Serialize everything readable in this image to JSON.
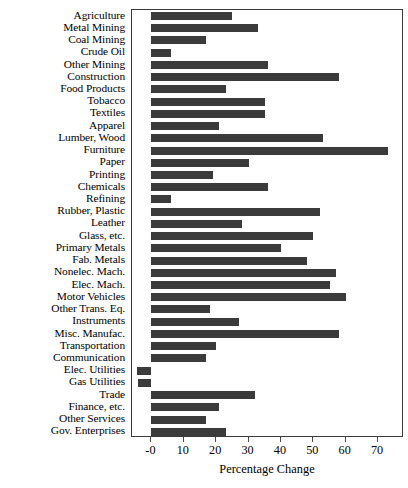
{
  "chart_data": {
    "type": "bar",
    "orientation": "horizontal",
    "title": "",
    "subtitle": "",
    "xlabel": "Percentage Change",
    "ylabel": "",
    "xlim": [
      -6,
      78
    ],
    "xticks": [
      0,
      10,
      20,
      30,
      40,
      50,
      60,
      70
    ],
    "xticklabels": [
      "-0",
      "10",
      "20",
      "30",
      "40",
      "50",
      "60",
      "70"
    ],
    "grid": false,
    "legend": null,
    "legend_position": "none",
    "bar_color": "#3b3b3b",
    "categories": [
      "Agriculture",
      "Metal Mining",
      "Coal Mining",
      "Crude Oil",
      "Other Mining",
      "Construction",
      "Food Products",
      "Tobacco",
      "Textiles",
      "Apparel",
      "Lumber, Wood",
      "Furniture",
      "Paper",
      "Printing",
      "Chemicals",
      "Refining",
      "Rubber, Plastic",
      "Leather",
      "Glass, etc.",
      "Primary Metals",
      "Fab. Metals",
      "Nonelec. Mach.",
      "Elec. Mach.",
      "Motor Vehicles",
      "Other Trans. Eq.",
      "Instruments",
      "Misc. Manufac.",
      "Transportation",
      "Communication",
      "Elec. Utilities",
      "Gas Utilities",
      "Trade",
      "Finance, etc.",
      "Other Services",
      "Gov. Enterprises"
    ],
    "values": [
      25,
      33,
      17,
      6,
      36,
      58,
      23,
      35,
      35,
      21,
      53,
      73,
      30,
      19,
      36,
      6,
      52,
      28,
      50,
      40,
      48,
      57,
      55,
      60,
      18,
      27,
      58,
      20,
      17,
      -4.5,
      -4,
      32,
      21,
      17,
      23
    ]
  }
}
